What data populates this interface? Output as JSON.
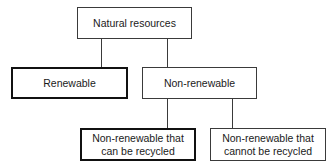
{
  "diagram": {
    "type": "hierarchy-tree",
    "nodes": [
      {
        "id": "root",
        "label": "Natural resources",
        "emphasized": false
      },
      {
        "id": "renewable",
        "label": "Renewable",
        "emphasized": true,
        "parent": "root"
      },
      {
        "id": "non_renewable",
        "label": "Non-renewable",
        "emphasized": false,
        "parent": "root"
      },
      {
        "id": "recyclable",
        "label_line1": "Non-renewable that",
        "label_line2": "can be recycled",
        "emphasized": true,
        "parent": "non_renewable"
      },
      {
        "id": "not_recyclable",
        "label_line1": "Non-renewable that",
        "label_line2": "cannot be recycled",
        "emphasized": false,
        "parent": "non_renewable"
      }
    ],
    "edges": [
      {
        "from": "root",
        "to": "renewable"
      },
      {
        "from": "root",
        "to": "non_renewable"
      },
      {
        "from": "non_renewable",
        "to": "recyclable"
      },
      {
        "from": "non_renewable",
        "to": "not_recyclable"
      }
    ]
  }
}
